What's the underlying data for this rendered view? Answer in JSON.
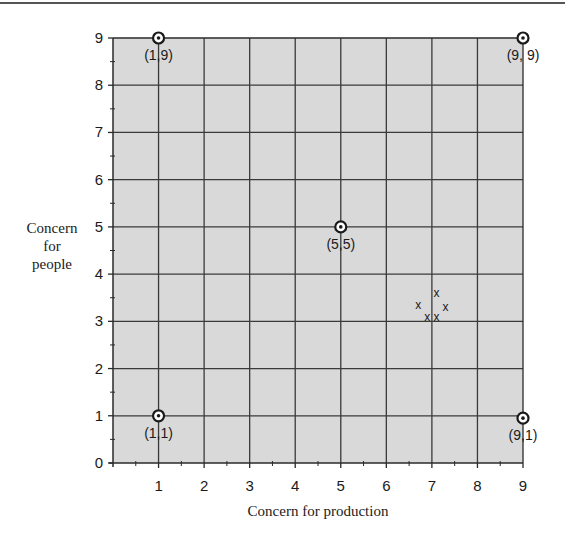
{
  "chart_data": {
    "type": "scatter",
    "title": "",
    "xlabel": "Concern for production",
    "ylabel_lines": [
      "Concern",
      "for",
      "people"
    ],
    "ylabel": "Concern for people",
    "xlim": [
      0,
      9
    ],
    "ylim": [
      0,
      9
    ],
    "x_ticks": [
      1,
      2,
      3,
      4,
      5,
      6,
      7,
      8,
      9
    ],
    "y_ticks": [
      0,
      1,
      2,
      3,
      4,
      5,
      6,
      7,
      8,
      9
    ],
    "grid": true,
    "minor_ticks": 0.5,
    "colors": {
      "plot_background": "#d9d9d9",
      "grid": "#3a3a3a",
      "axis": "#2a2a2a",
      "marker_ring": "#1a1a1a",
      "marker_fill": "#ffffff"
    },
    "series": [
      {
        "name": "Grid styles",
        "marker": "circled-dot",
        "points": [
          {
            "x": 1,
            "y": 9,
            "label": "(1,9)",
            "label_pos": "below"
          },
          {
            "x": 9,
            "y": 9,
            "label": "(9, 9)",
            "label_pos": "below"
          },
          {
            "x": 5,
            "y": 5,
            "label": "(5,5)",
            "label_pos": "below"
          },
          {
            "x": 1,
            "y": 1,
            "label": "(1,1)",
            "label_pos": "below"
          },
          {
            "x": 9,
            "y": 0.95,
            "label": "(9,1)",
            "label_pos": "below"
          }
        ]
      },
      {
        "name": "Cluster",
        "marker": "x",
        "points": [
          {
            "x": 7.1,
            "y": 3.6
          },
          {
            "x": 6.7,
            "y": 3.35
          },
          {
            "x": 7.3,
            "y": 3.3
          },
          {
            "x": 6.9,
            "y": 3.1
          },
          {
            "x": 7.1,
            "y": 3.1
          }
        ]
      }
    ]
  }
}
